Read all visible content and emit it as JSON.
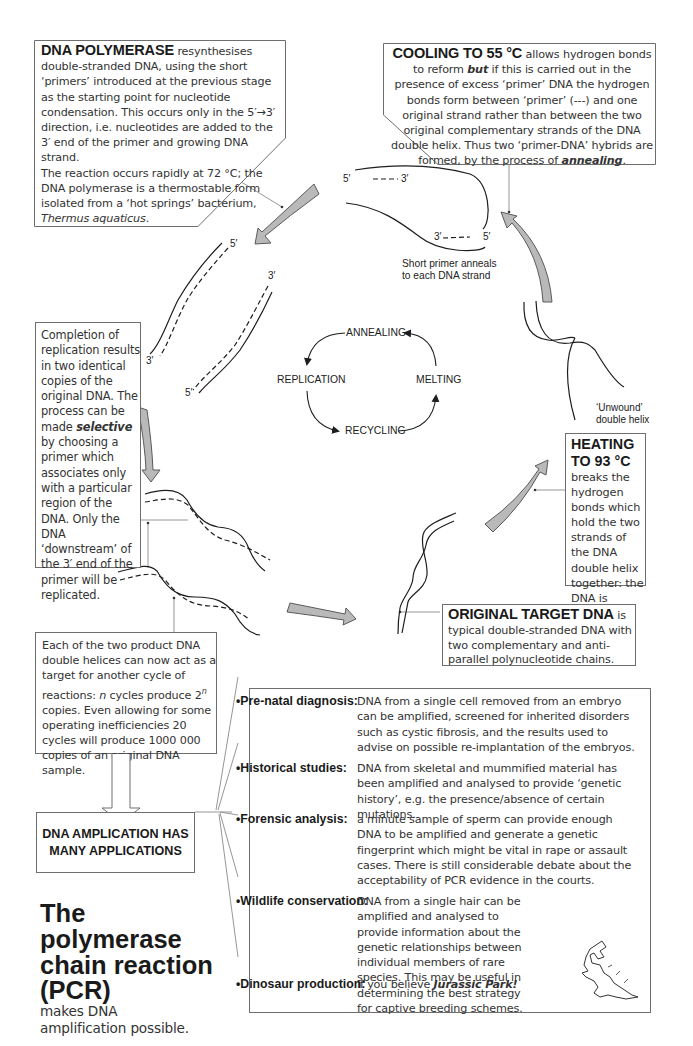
{
  "title": {
    "main": "The polymerase chain reaction (PCR)",
    "line1": "The polymerase",
    "line2": "chain reaction",
    "line3": "(PCR)",
    "subtitle": "makes DNA amplification possible."
  },
  "boxes": {
    "polymerase": {
      "heading": "DNA POLYMERASE",
      "text": " resynthesises double-stranded DNA, using the short ‘primers’ introduced at the previous stage as the starting point for nucleotide condensation. This occurs only in the 5′→3′ direction, i.e. nucleotides are added to the 3′ end of the primer and growing DNA strand.",
      "text2": "The reaction occurs rapidly at 72 °C; the DNA polymerase is a thermostable form isolated from a ‘hot springs’ bacterium,",
      "species": "Thermus aquaticus",
      "species_end": "."
    },
    "cooling": {
      "heading": "COOLING TO 55 °C",
      "text_a": " allows hydrogen bonds to reform ",
      "emph": "but",
      "text_b": " if this is carried out in the presence of excess ‘primer’ DNA the hydrogen bonds form between ‘primer’ (---) and one original strand rather than between the two original complementary strands of the DNA double helix. Thus two ‘primer-DNA’ hybrids are formed, by the process of",
      "term": "annealing",
      "end": "."
    },
    "completion": {
      "text_a": "Completion of replication results in two identical copies of the original DNA. The process can be made ",
      "emph": "selective",
      "text_b": " by choosing a primer which associates only with a particular region of the DNA. Only the DNA ‘downstream’ of the 3′ end of the primer will be replicated."
    },
    "heating": {
      "heading_1": "HEATING",
      "heading_2": "TO 93 °C",
      "text": "breaks the hydrogen bonds which hold the two strands of the DNA double helix together: the DNA is ‘",
      "term": "melted",
      "end": "’."
    },
    "original": {
      "heading": "ORIGINAL TARGET DNA",
      "text": " is typical double-stranded DNA with two complementary and anti-parallel polynucleotide chains."
    },
    "product": {
      "text_a": "Each of the two product DNA double helices can now act as a target for another cycle of reactions: ",
      "n": "n",
      "text_b": " cycles produce 2",
      "sup": "n",
      "text_c": " copies. Even allowing for some operating inefficiencies 20 cycles will produce 1000 000 copies of an original DNA sample."
    },
    "amplification": {
      "line1": "DNA AMPLICATION HAS",
      "line2": "MANY APPLICATIONS"
    }
  },
  "diagram": {
    "cycle": {
      "annealing": "ANNEALING",
      "replication": "REPLICATION",
      "melting": "MELTING",
      "recycling": "RECYCLING"
    },
    "labels": {
      "five_prime": "5′",
      "three_prime": "3′",
      "primer_caption_1": "Short primer anneals",
      "primer_caption_2": "to each DNA strand",
      "unwound_1": "‘Unwound’",
      "unwound_2": "double helix"
    },
    "colors": {
      "arrow_fill": "#b9b9b9",
      "arrow_stroke": "#5a5a5a",
      "strand": "#1e1e1e",
      "box_border": "#6e6e6e"
    }
  },
  "applications": [
    {
      "label": "•Pre-natal diagnosis:",
      "desc": "DNA from a single cell removed from an embryo can be amplified, screened for inherited disorders such as cystic fibrosis, and the results used to advise on possible re-implantation of the embryos."
    },
    {
      "label": "•Historical studies:",
      "desc": "DNA from skeletal and mummified material has been amplified and analysed to provide ‘genetic history’, e.g. the presence/absence of certain mutations."
    },
    {
      "label": "•Forensic analysis:",
      "desc": "a minute sample of sperm can provide enough DNA to be amplified and generate a genetic fingerprint which might be vital in rape or assault cases. There is still considerable debate about the acceptability of PCR evidence in the courts."
    },
    {
      "label": "•Wildlife conservation:",
      "desc": "DNA from a single hair can be amplified and analysed to provide information about the genetic relationships between individual members of rare species. This may be useful in determining the best strategy for captive breeding schemes."
    },
    {
      "label": "•Dinosaur production:",
      "desc_a": "if you believe ",
      "desc_emph": "Jurassic Park!"
    }
  ]
}
